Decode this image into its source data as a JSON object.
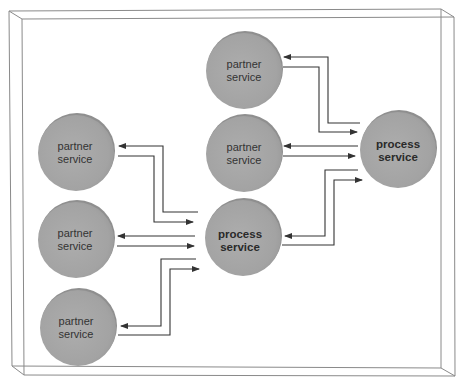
{
  "diagram": {
    "title": "",
    "colors": {
      "node_fill": "#a6a6a6",
      "node_shade": "#8c8c8c",
      "node_highlight": "#b8b8b8",
      "arrow": "#333333",
      "frame": "#888888"
    },
    "nodes": [
      {
        "id": "partner-top",
        "type": "partner",
        "line1": "partner",
        "line2": "service",
        "cx": 244,
        "cy": 70
      },
      {
        "id": "partner-mid-right",
        "type": "partner",
        "line1": "partner",
        "line2": "service",
        "cx": 244,
        "cy": 154
      },
      {
        "id": "process-right",
        "type": "process",
        "line1": "process",
        "line2": "service",
        "cx": 398,
        "cy": 150
      },
      {
        "id": "partner-left-1",
        "type": "partner",
        "line1": "partner",
        "line2": "service",
        "cx": 76,
        "cy": 153
      },
      {
        "id": "partner-left-2",
        "type": "partner",
        "line1": "partner",
        "line2": "service",
        "cx": 76,
        "cy": 240
      },
      {
        "id": "process-center",
        "type": "process",
        "line1": "process",
        "line2": "service",
        "cx": 243,
        "cy": 238
      },
      {
        "id": "partner-left-3",
        "type": "partner",
        "line1": "partner",
        "line2": "service",
        "cx": 78,
        "cy": 328
      }
    ],
    "connections": [
      {
        "from": "process-right",
        "to": "partner-top",
        "label": ""
      },
      {
        "from": "partner-top",
        "to": "process-right",
        "label": ""
      },
      {
        "from": "process-right",
        "to": "partner-mid-right",
        "label": ""
      },
      {
        "from": "partner-mid-right",
        "to": "process-right",
        "label": ""
      },
      {
        "from": "process-right",
        "to": "process-center",
        "label": ""
      },
      {
        "from": "process-center",
        "to": "process-right",
        "label": ""
      },
      {
        "from": "process-center",
        "to": "partner-left-1",
        "label": ""
      },
      {
        "from": "partner-left-1",
        "to": "process-center",
        "label": ""
      },
      {
        "from": "process-center",
        "to": "partner-left-2",
        "label": ""
      },
      {
        "from": "partner-left-2",
        "to": "process-center",
        "label": ""
      },
      {
        "from": "process-center",
        "to": "partner-left-3",
        "label": ""
      },
      {
        "from": "partner-left-3",
        "to": "process-center",
        "label": ""
      }
    ]
  }
}
